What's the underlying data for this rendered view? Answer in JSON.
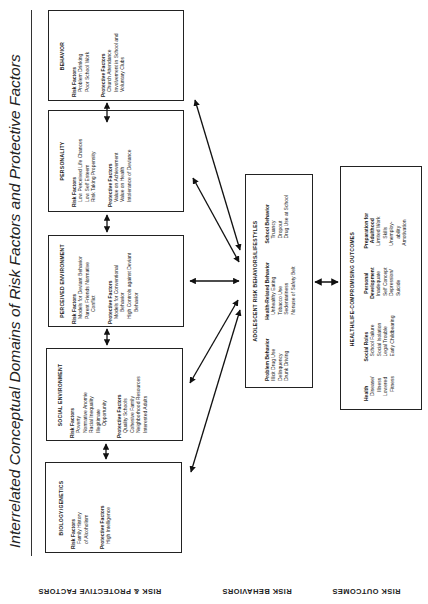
{
  "title": {
    "prefix": "Interrelated Conceptual Domains of ",
    "emphasis": "Risk Factors and Protective Factors"
  },
  "row_labels": {
    "risk_protective": "RISK & PROTECTIVE FACTORS",
    "risk_behaviors": "RISK BEHAVIORS",
    "risk_outcomes": "RISK OUTCOMES"
  },
  "domains": [
    {
      "heading": "BEHAVIOR",
      "risk_label": "Risk Factors",
      "risk_items": [
        "Problem Drinking",
        "Poor School Work"
      ],
      "protective_label": "Protective Factors",
      "protective_items": [
        "Church Attendance",
        "Involvement in School and",
        "Voluntary Clubs"
      ]
    },
    {
      "heading": "PERSONALITY",
      "risk_label": "Risk Factors",
      "risk_items": [
        "Low Perceived Life Chances",
        "Low Self Esteem",
        "Risk Taking Propensity"
      ],
      "protective_label": "Protective Factors",
      "protective_items": [
        "Value on Achievement",
        "Value on Health",
        "Intolerance of Deviance"
      ]
    },
    {
      "heading": "PERCEIVED ENVIRONMENT",
      "risk_label": "Risk Factors",
      "risk_items": [
        "Models for Deviant Behavior",
        "Parent Friends Normative",
        "Conflict"
      ],
      "protective_label": "Protective Factors",
      "protective_items": [
        "Models for Conventional",
        "Behavior",
        "High Controls against Deviant",
        "Behavior"
      ]
    },
    {
      "heading": "SOCIAL ENVIRONMENT",
      "risk_label": "Risk Factors",
      "risk_items": [
        "Poverty",
        "Normative Anomie",
        "Racial Inequality",
        "Illegitimate",
        "Opportunity"
      ],
      "protective_label": "Protective Factors",
      "protective_items": [
        "Quality Schools",
        "Cohesive Family",
        "Neighborhood Resources",
        "Interested Adults"
      ]
    },
    {
      "heading": "BIOLOGY/GENETICS",
      "risk_label": "Risk Factors",
      "risk_items": [
        "Family History",
        "of Alcoholism"
      ],
      "protective_label": "Protective Factors",
      "protective_items": [
        "High Intelligence"
      ]
    }
  ],
  "behaviors": {
    "heading": "ADOLESCENT RISK BEHAVIORS/LIFESTYLES",
    "columns": [
      {
        "label": "Problem Behavior",
        "items": [
          "Illicit Drug Use",
          "Delinquency",
          "Drunk Driving"
        ]
      },
      {
        "label": "Health-Related Behavior",
        "items": [
          "Unhealthy Eating",
          "Tobacco Use",
          "Sedentariness",
          "Nonuse of Safety Belt"
        ]
      },
      {
        "label": "School Behavior",
        "items": [
          "Truancy",
          "Dropout",
          "Drug Use at School"
        ]
      }
    ]
  },
  "outcomes": {
    "heading": "HEALTH/LIFE-COMPROMISING OUTCOMES",
    "columns": [
      {
        "label": "Health",
        "items": [
          "Disease/",
          "Illness",
          "Lowered",
          "Fitness"
        ]
      },
      {
        "label": "Social Roles",
        "items": [
          "School Failure",
          "Social Isolation",
          "Legal Trouble",
          "Early Childbearing"
        ]
      },
      {
        "label": "Personal Development",
        "items": [
          "Inadequate",
          "Self Concept",
          "Depression/",
          "Suicide"
        ]
      },
      {
        "label": "Preparation for Adulthood",
        "items": [
          "Limited Work",
          "Skills",
          "Unemploy-",
          "ability",
          "Amotivation"
        ]
      }
    ]
  }
}
